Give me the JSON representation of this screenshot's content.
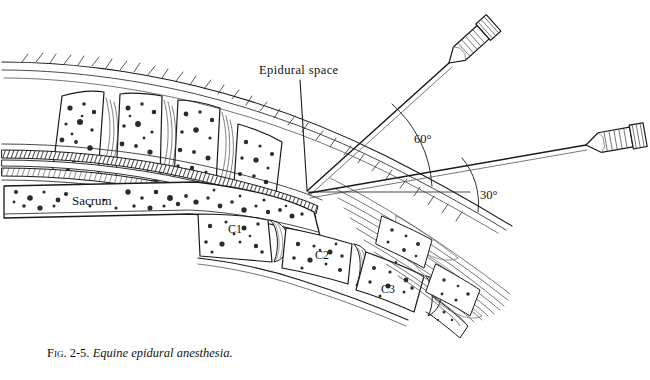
{
  "figure": {
    "caption_number": "Fig. 2-5.",
    "caption_title": "Equine epidural anesthesia.",
    "labels": {
      "epidural_space": "Epidural space",
      "sacrum": "Sacrum",
      "vertebra_c1": "C1",
      "vertebra_c2": "C2",
      "vertebra_c3": "C3"
    },
    "angles": {
      "upper_needle": "60°",
      "lower_needle": "30°"
    },
    "colors": {
      "ink": "#1a1a1a",
      "paper": "#ffffff",
      "stipple": "#2b2b2b",
      "shade": "#6b6b6b"
    }
  }
}
